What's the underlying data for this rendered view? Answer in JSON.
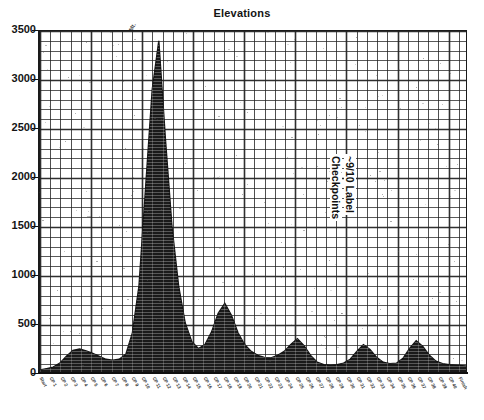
{
  "chart_data": {
    "type": "area",
    "title": "Elevations",
    "xlabel": "",
    "ylabel": "",
    "ylim": [
      0,
      3500
    ],
    "yticks": [
      0,
      500,
      1000,
      1500,
      2000,
      2500,
      3000,
      3500
    ],
    "ytick_labels": [
      "0",
      "500",
      "1000",
      "1500",
      "2000",
      "2500",
      "3000",
      "3500"
    ],
    "grid": true,
    "grid_style": "dense minor grid, both axes",
    "legend": "none",
    "annotations": [
      {
        "text": "~9/10 Label",
        "rotation": 90,
        "x_frac": 0.66,
        "y_value": 2000
      },
      {
        "text": "Checkpoints",
        "rotation": 90,
        "x_frac": 0.63,
        "y_value": 2000
      },
      {
        "text": "Mt.",
        "rotation": -62,
        "x_frac": 0.22,
        "y_value": 3400
      }
    ],
    "x_tick_count": 42,
    "x_tick_labels_note": "rotated checkpoint names, illegible at source resolution",
    "xticks_labels": [
      "Start",
      "CP 1",
      "CP 2",
      "CP 3",
      "CP 4",
      "CP 5",
      "CP 6",
      "CP 7",
      "CP 8",
      "CP 9",
      "CP 10",
      "CP 11",
      "CP 12",
      "CP 13",
      "CP 14",
      "CP 15",
      "CP 16",
      "CP 17",
      "CP 18",
      "CP 19",
      "CP 20",
      "CP 21",
      "CP 22",
      "CP 23",
      "CP 24",
      "CP 25",
      "CP 26",
      "CP 27",
      "CP 28",
      "CP 29",
      "CP 30",
      "CP 31",
      "CP 32",
      "CP 33",
      "CP 34",
      "CP 35",
      "CP 36",
      "CP 37",
      "CP 38",
      "CP 39",
      "CP 40",
      "Finish"
    ],
    "series": [
      {
        "name": "Elevation",
        "values": [
          40,
          55,
          70,
          110,
          180,
          240,
          255,
          235,
          210,
          180,
          150,
          140,
          150,
          200,
          420,
          900,
          1900,
          2900,
          3400,
          2400,
          1500,
          900,
          520,
          330,
          260,
          300,
          430,
          620,
          720,
          600,
          420,
          300,
          230,
          190,
          170,
          165,
          190,
          230,
          300,
          360,
          290,
          190,
          120,
          95,
          90,
          95,
          110,
          150,
          230,
          300,
          250,
          170,
          120,
          105,
          110,
          160,
          260,
          340,
          280,
          190,
          130,
          105,
          95,
          90,
          85,
          80
        ]
      }
    ]
  },
  "chart": {
    "title": "Elevations",
    "peak_label": "Mt.",
    "annotation_line1": "~9/10 Label",
    "annotation_line2": "Checkpoints"
  },
  "colors": {
    "ink": "#111111",
    "grid": "#2a2a2a",
    "fill": "#1a1a1a",
    "background": "#ffffff"
  }
}
